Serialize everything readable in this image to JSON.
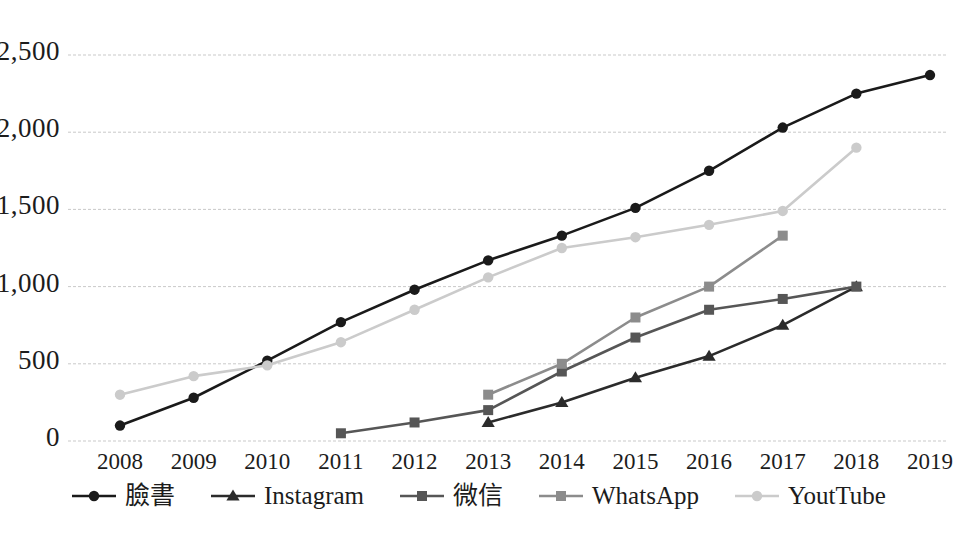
{
  "chart_data": {
    "type": "line",
    "title": "",
    "xlabel": "",
    "ylabel": "",
    "x": [
      2008,
      2009,
      2010,
      2011,
      2012,
      2013,
      2014,
      2015,
      2016,
      2017,
      2018,
      2019
    ],
    "xtick_labels": [
      "2008",
      "2009",
      "2010",
      "2011",
      "2012",
      "2013",
      "2014",
      "2015",
      "2016",
      "2017",
      "2018",
      "2019"
    ],
    "ytick_labels": [
      "0",
      "500",
      "1,000",
      "1,500",
      "2,000",
      "2,500"
    ],
    "ytick_values": [
      0,
      500,
      1000,
      1500,
      2000,
      2500
    ],
    "ylim": [
      0,
      2500
    ],
    "xlim": [
      2008,
      2019
    ],
    "grid": true,
    "legend_position": "bottom",
    "series": [
      {
        "name": "臉書",
        "color": "#1a1a1a",
        "marker": "circle",
        "x": [
          2008,
          2009,
          2010,
          2011,
          2012,
          2013,
          2014,
          2015,
          2016,
          2017,
          2018,
          2019
        ],
        "values": [
          100,
          280,
          520,
          770,
          980,
          1170,
          1330,
          1510,
          1750,
          2030,
          2250,
          2370
        ]
      },
      {
        "name": "Instagram",
        "color": "#2b2b2b",
        "marker": "triangle",
        "x": [
          2013,
          2014,
          2015,
          2016,
          2017,
          2018
        ],
        "values": [
          120,
          250,
          410,
          550,
          750,
          1000
        ]
      },
      {
        "name": "微信",
        "color": "#565656",
        "marker": "square",
        "x": [
          2011,
          2012,
          2013,
          2014,
          2015,
          2016,
          2017,
          2018
        ],
        "values": [
          50,
          120,
          200,
          450,
          670,
          850,
          920,
          1000
        ]
      },
      {
        "name": "WhatsApp",
        "color": "#8c8c8c",
        "marker": "square",
        "x": [
          2013,
          2014,
          2015,
          2016,
          2017
        ],
        "values": [
          300,
          500,
          800,
          1000,
          1330
        ]
      },
      {
        "name": "YoutTube",
        "color": "#cbcbcb",
        "marker": "diamond",
        "x": [
          2008,
          2009,
          2010,
          2011,
          2012,
          2013,
          2014,
          2015,
          2016,
          2017,
          2018
        ],
        "values": [
          300,
          420,
          490,
          640,
          850,
          1060,
          1250,
          1320,
          1400,
          1490,
          1900
        ]
      }
    ]
  },
  "legend": {
    "items": [
      {
        "label": "臉書",
        "marker": "circle-marker-icon"
      },
      {
        "label": "Instagram",
        "marker": "triangle-marker-icon"
      },
      {
        "label": "微信",
        "marker": "square-marker-icon"
      },
      {
        "label": "WhatsApp",
        "marker": "square-marker-icon"
      },
      {
        "label": "YoutTube",
        "marker": "diamond-marker-icon"
      }
    ]
  },
  "colors": {
    "grid": "#c9c9c9",
    "background": "#ffffff",
    "text": "#1c1c1c"
  }
}
